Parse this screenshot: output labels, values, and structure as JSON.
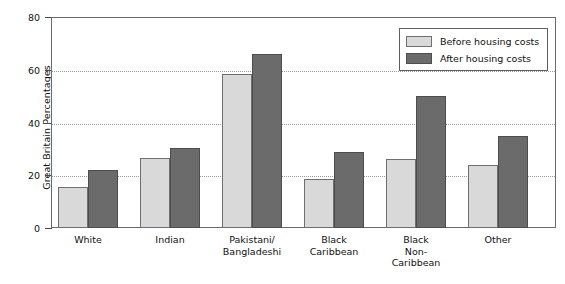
{
  "chart_data": {
    "type": "bar",
    "title": "",
    "xlabel": "",
    "ylabel": "Great Britain Percentages",
    "ylim": [
      0,
      80
    ],
    "yticks": [
      0,
      20,
      40,
      60,
      80
    ],
    "grid": "horizontal-dotted",
    "legend_position": "top-right",
    "categories": [
      "White",
      "Pakistani/\nBangladeshi",
      "Indian",
      "Black\nCaribbean",
      "Black\nNon-\nCaribbean",
      "Other"
    ],
    "category_lines": [
      [
        "White"
      ],
      [
        "Indian"
      ],
      [
        "Pakistani/",
        "Bangladeshi"
      ],
      [
        "Black",
        "Caribbean"
      ],
      [
        "Black",
        "Non-",
        "Caribbean"
      ],
      [
        "Other"
      ]
    ],
    "series": [
      {
        "name": "Before housing costs",
        "color": "#d9d9d9",
        "values": [
          15.5,
          26.5,
          58.5,
          18.5,
          26,
          24
        ]
      },
      {
        "name": "After housing costs",
        "color": "#6b6b6b",
        "values": [
          22,
          30.5,
          66,
          29,
          50,
          35
        ]
      }
    ]
  },
  "axis": {
    "y_title": "Great Britain Percentages",
    "y_tick_labels": [
      "80",
      "60",
      "40",
      "20",
      "0"
    ]
  },
  "legend": {
    "items": [
      {
        "label": "Before housing costs",
        "swatch": "before"
      },
      {
        "label": "After housing costs",
        "swatch": "after"
      }
    ]
  }
}
